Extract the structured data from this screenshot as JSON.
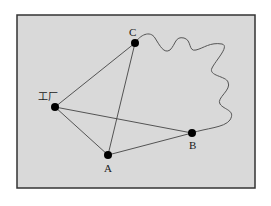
{
  "diagram": {
    "frame": {
      "x": 17,
      "y": 15,
      "width": 238,
      "height": 173,
      "fill": "#d9d9d9",
      "stroke": "#333333"
    },
    "colors": {
      "line": "#444444",
      "node": "#000000",
      "squiggle": "#555555"
    },
    "nodes": [
      {
        "id": "factory",
        "label": "工厂",
        "x": 55,
        "y": 107,
        "label_x": 38,
        "label_y": 100
      },
      {
        "id": "C",
        "label": "C",
        "x": 135,
        "y": 43,
        "label_x": 129,
        "label_y": 36
      },
      {
        "id": "A",
        "label": "A",
        "x": 108,
        "y": 155,
        "label_x": 104,
        "label_y": 172
      },
      {
        "id": "B",
        "label": "B",
        "x": 192,
        "y": 133,
        "label_x": 189,
        "label_y": 149
      }
    ],
    "edges": [
      {
        "from": "factory",
        "to": "C"
      },
      {
        "from": "factory",
        "to": "A"
      },
      {
        "from": "factory",
        "to": "B"
      },
      {
        "from": "C",
        "to": "A"
      },
      {
        "from": "A",
        "to": "B"
      }
    ],
    "squiggle": {
      "from": "C",
      "to": "B",
      "path": "M135,43 C140,35 150,30 155,38 C160,46 164,54 170,50 C176,44 175,36 184,38 C192,40 188,52 196,50 C204,48 210,42 222,44 C230,46 216,60 212,68 C208,76 226,76 228,82 C232,90 216,98 220,104 C224,110 236,110 230,120 C224,128 206,128 192,133"
    }
  }
}
